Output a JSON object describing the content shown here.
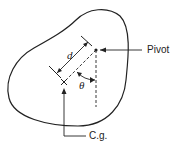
{
  "diagram": {
    "type": "pendulum-body",
    "labels": {
      "pivot": "Pivot",
      "cg": "C.g.",
      "distance": "d",
      "angle": "θ"
    },
    "colors": {
      "stroke": "#222222",
      "background": "#ffffff"
    }
  }
}
